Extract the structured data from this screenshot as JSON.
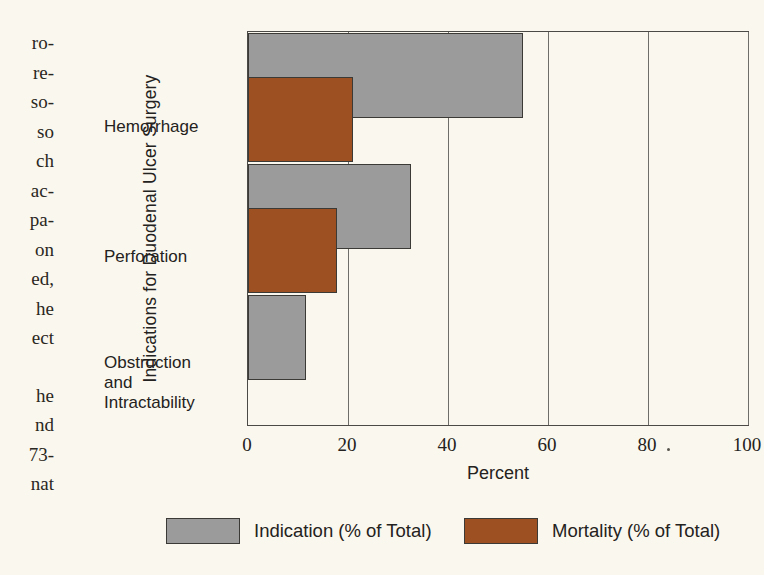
{
  "page_background": "#faf7ee",
  "body_text_fragments": {
    "upper": [
      "ro-",
      "re-",
      "so-",
      "so",
      "ch",
      "ac-",
      "pa-",
      "on",
      "ed,",
      "he",
      "ect"
    ],
    "lower": [
      "he",
      "nd",
      "73-",
      "nat"
    ]
  },
  "chart_data": {
    "type": "bar",
    "orientation": "horizontal",
    "title": "",
    "xlabel": "Percent",
    "ylabel": "Indications for Duodenal Ulcer Surgery",
    "categories": [
      "Hemorrhage",
      "Perforation",
      "Obstruction and Intractability"
    ],
    "category_label_lines": [
      [
        "Hemorrhage"
      ],
      [
        "Perforation"
      ],
      [
        "Obstruction",
        "and",
        "Intractability"
      ]
    ],
    "series": [
      {
        "name": "Indication (% of Total)",
        "color": "#9b9b9b",
        "values": [
          55,
          32.5,
          11.5
        ]
      },
      {
        "name": "Mortality (% of Total)",
        "color": "#9d5021",
        "values": [
          21,
          17.8,
          0
        ]
      }
    ],
    "xlim": [
      0,
      100
    ],
    "xticks": [
      0,
      20,
      40,
      60,
      80,
      100
    ],
    "xtick_labels": [
      "0",
      "20",
      "40",
      "60",
      "80",
      "100"
    ],
    "grid": true,
    "legend_position": "bottom"
  }
}
